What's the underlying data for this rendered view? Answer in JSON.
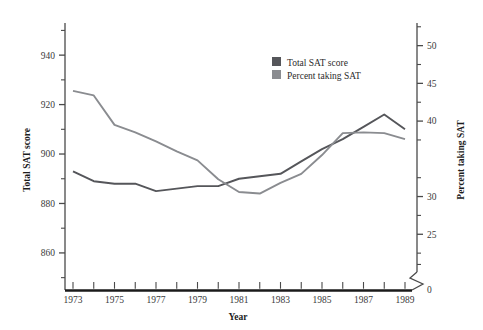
{
  "chart_data": {
    "type": "line",
    "title": "",
    "xlabel": "Year",
    "x": [
      1973,
      1974,
      1975,
      1976,
      1977,
      1978,
      1979,
      1980,
      1981,
      1982,
      1983,
      1984,
      1985,
      1986,
      1987,
      1988,
      1989
    ],
    "xtick_labels": [
      "1973",
      "1975",
      "1977",
      "1979",
      "1981",
      "1983",
      "1985",
      "1987",
      "1989"
    ],
    "xtick_values": [
      1973,
      1975,
      1977,
      1979,
      1981,
      1983,
      1985,
      1987,
      1989
    ],
    "grid": false,
    "legend_position": "upper-right",
    "left_axis": {
      "label": "Total SAT score",
      "tick_labels": [
        "860",
        "880",
        "900",
        "920",
        "940"
      ],
      "tick_values": [
        860,
        880,
        900,
        920,
        940
      ],
      "minor_tick_values": [
        850,
        870,
        890,
        910,
        930,
        950
      ],
      "ylim": [
        845,
        953
      ]
    },
    "right_axis": {
      "label": "Percent taking SAT",
      "tick_labels": [
        "50",
        "45",
        "40",
        "30",
        "25",
        "0"
      ],
      "tick_values": [
        50,
        45,
        40,
        30,
        25,
        0
      ],
      "minor_tick_values": [
        52.5,
        47.5,
        42.5,
        37.5,
        32.5,
        27.5,
        22.5,
        21
      ],
      "ylim": [
        20,
        53
      ],
      "has_axis_break": true,
      "break_label": "0"
    },
    "series": [
      {
        "name": "Total SAT score",
        "axis": "left",
        "color": "#55565a",
        "values": [
          893,
          889,
          888,
          888,
          885,
          886,
          887,
          887,
          890,
          891,
          892,
          897,
          902,
          906,
          911,
          916,
          910
        ]
      },
      {
        "name": "Percent taking SAT",
        "axis": "right",
        "color": "#8a8c90",
        "values": [
          44.0,
          43.4,
          39.5,
          38.5,
          37.3,
          36.0,
          34.8,
          32.3,
          30.6,
          30.4,
          31.8,
          33.0,
          35.5,
          38.4,
          38.5,
          38.4,
          37.6
        ]
      }
    ]
  },
  "legend": {
    "entries": [
      {
        "label": "Total SAT score",
        "swatch_color": "#55565a"
      },
      {
        "label": "Percent taking SAT",
        "swatch_color": "#8a8c90"
      }
    ]
  },
  "axes": {
    "left_title": "Total SAT score",
    "right_title": "Percent taking SAT",
    "x_title": "Year"
  },
  "colors": {
    "axis": "#4a4a4a",
    "baseline": "#1a1a1a",
    "series_dark": "#55565a",
    "series_light": "#8a8c90",
    "text": "#2b2b2b",
    "background": "#ffffff"
  }
}
